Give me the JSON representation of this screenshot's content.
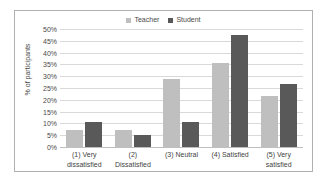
{
  "chart_data": {
    "type": "bar",
    "title": "",
    "xlabel": "",
    "ylabel": "% of participants",
    "ylim": [
      0,
      50
    ],
    "ytick_labels": [
      "50%",
      "45%",
      "40%",
      "35%",
      "30%",
      "25%",
      "20%",
      "15%",
      "10%",
      "5%",
      "0%"
    ],
    "ytick_values": [
      50,
      45,
      40,
      35,
      30,
      25,
      20,
      15,
      10,
      5,
      0
    ],
    "grid": true,
    "legend_position": "top-center",
    "categories": [
      "(1) Very dissatisfied",
      "(2) Dissatisfied",
      "(3) Neutral",
      "(4) Satisfied",
      "(5) Very satisfied"
    ],
    "category_lines": [
      [
        "(1) Very",
        "dissatisfied"
      ],
      [
        "(2)",
        "Dissatisfied"
      ],
      [
        "(3) Neutral",
        ""
      ],
      [
        "(4) Satisfied",
        ""
      ],
      [
        "(5) Very",
        "satisfied"
      ]
    ],
    "series": [
      {
        "name": "Teacher",
        "color": "#bfbfbf",
        "values": [
          7,
          7,
          29,
          35.5,
          21.5
        ]
      },
      {
        "name": "Student",
        "color": "#595959",
        "values": [
          10.5,
          5,
          10.5,
          47.5,
          26.5
        ]
      }
    ]
  },
  "legend": {
    "entries": [
      {
        "label": "Teacher",
        "color": "#bfbfbf"
      },
      {
        "label": "Student",
        "color": "#595959"
      }
    ]
  },
  "axes": {
    "y_title": "% of participants"
  }
}
